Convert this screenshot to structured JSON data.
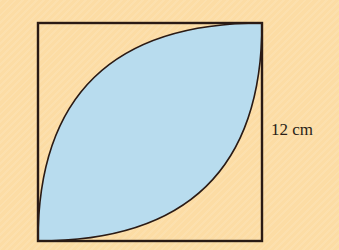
{
  "diagram": {
    "type": "geometry-square-with-lens",
    "side_label": "12 cm",
    "colors": {
      "background": "#fcdca4",
      "shaded_region": "#b8dcee",
      "stroke": "#2a1a14"
    }
  }
}
